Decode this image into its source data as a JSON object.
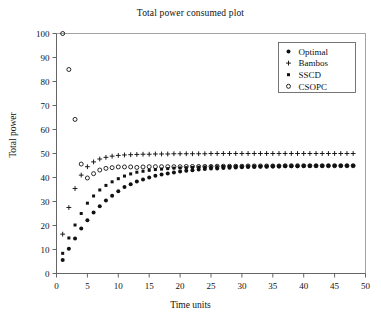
{
  "chart_data": {
    "type": "scatter",
    "title": "Total power consumed plot",
    "xlabel": "Time units",
    "ylabel": "Total power",
    "xlim": [
      0,
      50
    ],
    "ylim": [
      0,
      100
    ],
    "xticks": [
      0,
      5,
      10,
      15,
      20,
      25,
      30,
      35,
      40,
      45,
      50
    ],
    "yticks": [
      0,
      10,
      20,
      30,
      40,
      50,
      60,
      70,
      80,
      90,
      100
    ],
    "grid": false,
    "legend_position": "top-right",
    "x": [
      1,
      2,
      3,
      4,
      5,
      6,
      7,
      8,
      9,
      10,
      11,
      12,
      13,
      14,
      15,
      16,
      17,
      18,
      19,
      20,
      21,
      22,
      23,
      24,
      25,
      26,
      27,
      28,
      29,
      30,
      31,
      32,
      33,
      34,
      35,
      36,
      37,
      38,
      39,
      40,
      41,
      42,
      43,
      44,
      45,
      46,
      47,
      48
    ],
    "series": [
      {
        "name": "Optimal",
        "marker": "filled-circle",
        "color": "#111111",
        "values": [
          5.6,
          10.3,
          14.6,
          18.7,
          22.2,
          25.4,
          28.0,
          30.4,
          32.4,
          34.3,
          36.0,
          37.2,
          38.3,
          39.2,
          40.0,
          40.7,
          41.2,
          41.7,
          42.1,
          42.5,
          42.8,
          43.0,
          43.3,
          43.5,
          43.7,
          43.8,
          44.0,
          44.1,
          44.2,
          44.3,
          44.4,
          44.4,
          44.5,
          44.5,
          44.6,
          44.6,
          44.7,
          44.7,
          44.7,
          44.8,
          44.8,
          44.8,
          44.8,
          44.9,
          44.9,
          44.9,
          44.9,
          44.9
        ]
      },
      {
        "name": "Bambos",
        "marker": "plus",
        "color": "#111111",
        "values": [
          16.4,
          27.5,
          35.4,
          41.0,
          44.5,
          46.5,
          47.7,
          48.4,
          48.9,
          49.2,
          49.4,
          49.5,
          49.6,
          49.7,
          49.7,
          49.8,
          49.8,
          49.8,
          49.9,
          49.9,
          49.9,
          49.9,
          49.9,
          49.9,
          50.0,
          50.0,
          50.0,
          50.0,
          50.0,
          50.0,
          50.0,
          50.0,
          50.0,
          50.0,
          50.0,
          50.0,
          50.0,
          50.0,
          50.0,
          50.0,
          50.0,
          50.0,
          50.0,
          50.0,
          50.0,
          50.0,
          50.0,
          50.0
        ]
      },
      {
        "name": "SSCD",
        "marker": "filled-square",
        "color": "#111111",
        "values": [
          8.4,
          14.8,
          20.2,
          25.0,
          29.3,
          32.3,
          34.8,
          36.7,
          38.2,
          39.5,
          40.6,
          41.5,
          42.2,
          42.6,
          43.0,
          43.3,
          43.5,
          43.7,
          43.9,
          44.0,
          44.1,
          44.2,
          44.3,
          44.4,
          44.5,
          44.5,
          44.6,
          44.6,
          44.7,
          44.7,
          44.8,
          44.8,
          44.8,
          44.8,
          44.9,
          44.9,
          44.9,
          44.9,
          44.9,
          44.9,
          44.9,
          45.0,
          45.0,
          45.0,
          45.0,
          45.0,
          45.0,
          45.0
        ]
      },
      {
        "name": "CSOPC",
        "marker": "open-circle",
        "color": "#111111",
        "values": [
          100.0,
          85.0,
          64.2,
          45.6,
          39.8,
          41.6,
          43.1,
          43.8,
          44.1,
          44.4,
          44.4,
          44.4,
          44.2,
          44.4,
          44.5,
          44.5,
          44.5,
          44.5,
          44.5,
          44.5,
          44.6,
          44.6,
          44.6,
          44.6,
          44.6,
          44.7,
          44.7,
          44.7,
          44.7,
          44.7,
          44.8,
          44.8,
          44.8,
          44.8,
          44.8,
          44.8,
          44.9,
          44.9,
          44.9,
          44.9,
          44.9,
          44.9,
          44.9,
          44.9,
          44.9,
          44.9,
          44.9,
          44.9
        ]
      }
    ]
  },
  "legend": {
    "entries": [
      {
        "label": "Optimal",
        "marker": "filled-circle"
      },
      {
        "label": "Bambos",
        "marker": "plus"
      },
      {
        "label": "SSCD",
        "marker": "filled-square"
      },
      {
        "label": "CSOPC",
        "marker": "open-circle"
      }
    ]
  }
}
